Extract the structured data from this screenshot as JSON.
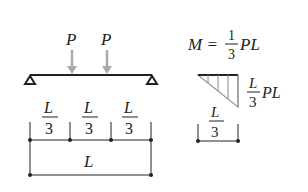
{
  "beam_diagram": {
    "loads": [
      {
        "label": "P",
        "x": 72
      },
      {
        "label": "P",
        "x": 107
      }
    ],
    "segments": [
      {
        "num": "L",
        "den": "3"
      },
      {
        "num": "L",
        "den": "3"
      },
      {
        "num": "L",
        "den": "3"
      }
    ],
    "total_length": "L"
  },
  "moment_diagram": {
    "equation_lhs": "M =",
    "equation_num": "1",
    "equation_den": "3",
    "equation_rhs": "PL",
    "peak_num": "L",
    "peak_den": "3",
    "peak_rhs": "PL",
    "span_num": "L",
    "span_den": "3"
  },
  "colors": {
    "line": "#222222",
    "arrow": "#aaaaaa",
    "moment_fill": "#888888"
  }
}
